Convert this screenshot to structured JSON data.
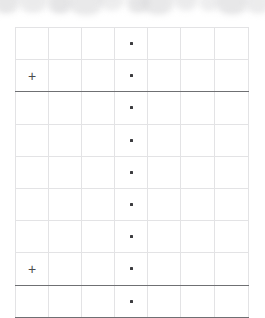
{
  "page": {
    "kind": "scanned-form-grid",
    "background_color": "#ffffff",
    "grid_line_color": "#e3e3e5",
    "rule_color": "#6f7073",
    "mark_color": "#3c3c3f"
  },
  "artifact_band": {
    "name": "scan-artifact-band",
    "description": "blurred grey circular smudges along the top of the scan",
    "blob_color": "#d4d4d6",
    "blobs": [
      {
        "cx": 6,
        "cy": 2,
        "r": 13,
        "opacity": 0.55
      },
      {
        "cx": 33,
        "cy": -1,
        "r": 15,
        "opacity": 0.45
      },
      {
        "cx": 60,
        "cy": 3,
        "r": 12,
        "opacity": 0.6
      },
      {
        "cx": 86,
        "cy": 1,
        "r": 17,
        "opacity": 0.5
      },
      {
        "cx": 112,
        "cy": -2,
        "r": 13,
        "opacity": 0.42
      },
      {
        "cx": 138,
        "cy": 3,
        "r": 11,
        "opacity": 0.58
      },
      {
        "cx": 158,
        "cy": 1,
        "r": 16,
        "opacity": 0.52
      },
      {
        "cx": 186,
        "cy": -1,
        "r": 12,
        "opacity": 0.46
      },
      {
        "cx": 209,
        "cy": 2,
        "r": 10,
        "opacity": 0.4
      },
      {
        "cx": 232,
        "cy": 1,
        "r": 16,
        "opacity": 0.55
      },
      {
        "cx": 258,
        "cy": 3,
        "r": 12,
        "opacity": 0.44
      }
    ]
  },
  "table": {
    "name": "form-grid",
    "columns": 7,
    "rows": 9,
    "column_widths": [
      33,
      33,
      33,
      33,
      33,
      34,
      34
    ],
    "glyphs": {
      "plus": "+",
      "dot": "·"
    },
    "rows_data": [
      {
        "index": 1,
        "cells": [
          "",
          "",
          "",
          "dot",
          "",
          "",
          ""
        ],
        "rule_below": "none"
      },
      {
        "index": 2,
        "cells": [
          "plus",
          "",
          "",
          "dot",
          "",
          "",
          ""
        ],
        "rule_below": "thick"
      },
      {
        "index": 3,
        "cells": [
          "",
          "",
          "",
          "dot",
          "",
          "",
          ""
        ],
        "rule_below": "none"
      },
      {
        "index": 4,
        "cells": [
          "",
          "",
          "",
          "dot",
          "",
          "",
          ""
        ],
        "rule_below": "none"
      },
      {
        "index": 5,
        "cells": [
          "",
          "",
          "",
          "dot",
          "",
          "",
          ""
        ],
        "rule_below": "none"
      },
      {
        "index": 6,
        "cells": [
          "",
          "",
          "",
          "dot",
          "",
          "",
          ""
        ],
        "rule_below": "none"
      },
      {
        "index": 7,
        "cells": [
          "",
          "",
          "",
          "dot",
          "",
          "",
          ""
        ],
        "rule_below": "none"
      },
      {
        "index": 8,
        "cells": [
          "plus",
          "",
          "",
          "dot",
          "",
          "",
          ""
        ],
        "rule_below": "thick"
      },
      {
        "index": 9,
        "cells": [
          "",
          "",
          "",
          "dot",
          "",
          "",
          ""
        ],
        "rule_below": "thick"
      }
    ]
  }
}
